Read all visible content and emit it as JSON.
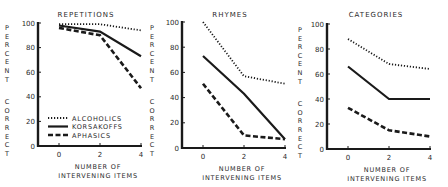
{
  "chart_data": [
    {
      "type": "line",
      "title": "REPETITIONS",
      "xlabel": "NUMBER OF INTERVENING ITEMS",
      "xlabel_lines": [
        "NUMBER  OF",
        "INTERVENING  ITEMS"
      ],
      "ylabel": "PERCENT CORRECT",
      "ylabel_words": [
        "PERCENT",
        "CORRECT"
      ],
      "x": [
        0,
        2,
        4
      ],
      "xticks": [
        "0",
        "2",
        "4"
      ],
      "yticks": [
        "0",
        "20",
        "40",
        "60",
        "80",
        "100"
      ],
      "ylim": [
        0,
        100
      ],
      "grid": false,
      "legend_position": "lower-left",
      "series": [
        {
          "name": "ALCOHOLICS",
          "style": "dotted",
          "values": [
            99,
            99,
            94
          ]
        },
        {
          "name": "KORSAKOFFS",
          "style": "solid",
          "values": [
            98,
            93,
            73
          ]
        },
        {
          "name": "APHASICS",
          "style": "dashed",
          "values": [
            96,
            90,
            47
          ]
        }
      ]
    },
    {
      "type": "line",
      "title": "RHYMES",
      "xlabel": "NUMBER OF INTERVENING ITEMS",
      "xlabel_lines": [
        "NUMBER  OF",
        "INTERVENING  ITEMS"
      ],
      "ylabel": "PERCENT CORRECT",
      "ylabel_words": [
        "PERCENT",
        "CORRECT"
      ],
      "x": [
        0,
        2,
        4
      ],
      "xticks": [
        "0",
        "2",
        "4"
      ],
      "yticks": [
        "0",
        "20",
        "40",
        "60",
        "80",
        "100"
      ],
      "ylim": [
        0,
        100
      ],
      "grid": false,
      "series": [
        {
          "name": "ALCOHOLICS",
          "style": "dotted",
          "values": [
            100,
            57,
            51
          ]
        },
        {
          "name": "KORSAKOFFS",
          "style": "solid",
          "values": [
            73,
            43,
            7
          ]
        },
        {
          "name": "APHASICS",
          "style": "dashed",
          "values": [
            51,
            10,
            7
          ]
        }
      ]
    },
    {
      "type": "line",
      "title": "CATEGORIES",
      "xlabel": "NUMBER OF INTERVENING ITEMS",
      "xlabel_lines": [
        "NUMBER  OF",
        "INTERVENING  ITEMS"
      ],
      "ylabel": "PERCENT CORRECT",
      "ylabel_words": [
        "PERCENT",
        "CORRECT"
      ],
      "x": [
        0,
        2,
        4
      ],
      "xticks": [
        "0",
        "2",
        "4"
      ],
      "yticks": [
        "0",
        "20",
        "40",
        "60",
        "80",
        "100"
      ],
      "ylim": [
        0,
        100
      ],
      "grid": false,
      "series": [
        {
          "name": "ALCOHOLICS",
          "style": "dotted",
          "values": [
            88,
            68,
            64
          ]
        },
        {
          "name": "KORSAKOFFS",
          "style": "solid",
          "values": [
            66,
            40,
            40
          ]
        },
        {
          "name": "APHASICS",
          "style": "dashed",
          "values": [
            33,
            15,
            10
          ]
        }
      ]
    }
  ],
  "legend": {
    "items": [
      {
        "label": "ALCOHOLICS",
        "style": "dotted"
      },
      {
        "label": "KORSAKOFFS",
        "style": "solid"
      },
      {
        "label": "APHASICS",
        "style": "dashed"
      }
    ]
  },
  "colors": {
    "ink": "#1a1a1a",
    "background": "#ffffff"
  }
}
